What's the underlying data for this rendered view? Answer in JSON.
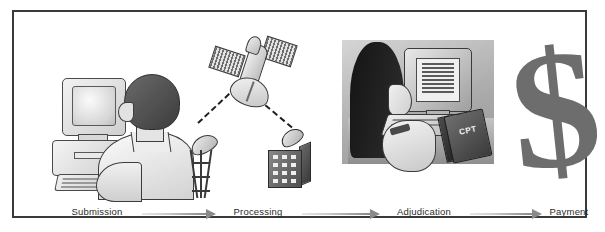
{
  "diagram": {
    "frame_color": "#3a3a3a",
    "background": "#ffffff",
    "accent_gray": "#8a8a8a"
  },
  "steps": [
    {
      "id": "submission",
      "label": "Submission",
      "illustration": "person-at-desktop-computer"
    },
    {
      "id": "processing",
      "label": "Processing",
      "illustration": "satellite-transmission"
    },
    {
      "id": "adjudication",
      "label": "Adjudication",
      "illustration": "coder-at-workstation-with-cpt-book"
    },
    {
      "id": "payment",
      "label": "Payment",
      "illustration": "dollar-sign"
    }
  ],
  "arrows": [
    {
      "id": "arrow-1",
      "from": "submission",
      "to": "processing"
    },
    {
      "id": "arrow-2",
      "from": "processing",
      "to": "adjudication"
    },
    {
      "id": "arrow-3",
      "from": "adjudication",
      "to": "payment"
    }
  ],
  "illustration_text": {
    "book_label": "CPT",
    "dollar_glyph": "$"
  }
}
